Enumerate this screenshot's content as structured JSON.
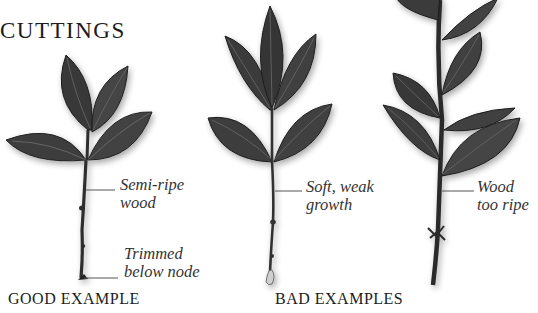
{
  "title": "CUTTINGS",
  "captions": {
    "good": "GOOD EXAMPLE",
    "bad": "BAD EXAMPLES"
  },
  "cuttings": [
    {
      "id": "good",
      "labels": [
        {
          "line1": "Semi-ripe",
          "line2": "wood"
        },
        {
          "line1": "Trimmed",
          "line2": "below node"
        }
      ]
    },
    {
      "id": "soft",
      "labels": [
        {
          "line1": "Soft, weak",
          "line2": "growth"
        }
      ]
    },
    {
      "id": "ripe",
      "labels": [
        {
          "line1": "Wood",
          "line2": "too ripe"
        }
      ]
    }
  ],
  "colors": {
    "leaf": "#3e3e3e",
    "leaf_dark": "#2a2a2a",
    "vein": "#6a6a6a",
    "stem": "#333333",
    "leader_line": "#555555"
  }
}
